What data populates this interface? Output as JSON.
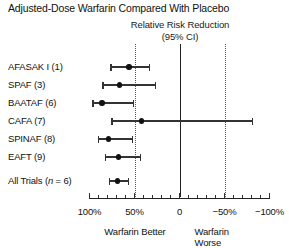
{
  "chart_data": {
    "type": "forest",
    "title": "Adjusted-Dose Warfarin Compared With Placebo",
    "header_line1": "Relative Risk Reduction",
    "header_line2": "(95% CI)",
    "xlabel_left": "Warfarin Better",
    "xlabel_right": "Warfarin Worse",
    "xlabel": "Relative Risk Reduction (95% CI)",
    "ylabel": "",
    "axis": {
      "ticklabels": [
        "100%",
        "50%",
        "0",
        "−50%",
        "−100%"
      ],
      "tickvalues": [
        100,
        50,
        0,
        -50,
        -100
      ],
      "minor_tick_step": 10,
      "xlim": [
        100,
        -100
      ],
      "reference_line_solid": 0,
      "reference_lines_dotted": [
        50,
        -50
      ],
      "grid": false,
      "direction": "decreasing"
    },
    "units": "percent relative risk reduction",
    "rows": [
      {
        "label": "AFASAK I (1)",
        "label_plain": "AFASAK I",
        "ref": "1",
        "estimate": 56,
        "ci_low": 33,
        "ci_high": 76
      },
      {
        "label": "SPAF (3)",
        "label_plain": "SPAF",
        "ref": "3",
        "estimate": 67,
        "ci_low": 27,
        "ci_high": 85
      },
      {
        "label": "BAATAF (6)",
        "label_plain": "BAATAF",
        "ref": "6",
        "estimate": 86,
        "ci_low": 51,
        "ci_high": 96
      },
      {
        "label": "CAFA (7)",
        "label_plain": "CAFA",
        "ref": "7",
        "estimate": 42,
        "ci_low": -81,
        "ci_high": 75
      },
      {
        "label": "SPINAF (8)",
        "label_plain": "SPINAF",
        "ref": "8",
        "estimate": 79,
        "ci_low": 52,
        "ci_high": 90
      },
      {
        "label": "EAFT (9)",
        "label_plain": "EAFT",
        "ref": "9",
        "estimate": 68,
        "ci_low": 43,
        "ci_high": 82
      }
    ],
    "summary": {
      "label_prefix": "All Trials (",
      "label_italic": "n",
      "label_suffix": " = 6)",
      "label": "All Trials (n = 6)",
      "n": 6,
      "estimate": 69,
      "ci_low": 57,
      "ci_high": 78
    },
    "colors": {
      "marker": "#111111",
      "line": "#333333",
      "axis": "#222222",
      "reference_dotted": "#555555",
      "background": "#ffffff"
    }
  }
}
